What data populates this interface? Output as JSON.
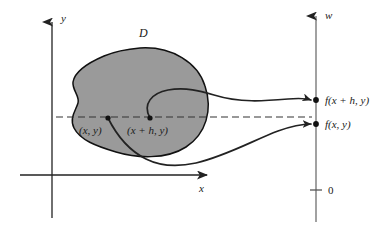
{
  "figure": {
    "background_color": "#ffffff",
    "line_color": "#222222",
    "region_fill_color": "#9a9a9a",
    "region_stroke_color": "#111111",
    "dash_color": "#333333"
  },
  "axes": {
    "y_axis_label": "y",
    "x_axis_label": "x",
    "w_axis_label": "w",
    "origin_tick_label": "0"
  },
  "region": {
    "label": "D"
  },
  "points": [
    {
      "id": "point-xy",
      "label": "(x, y)"
    },
    {
      "id": "point-xhy",
      "label": "(x + h, y)"
    }
  ],
  "values": [
    {
      "id": "value-fxhy",
      "label": "f(x + h, y)"
    },
    {
      "id": "value-fxy",
      "label": "f(x, y)"
    }
  ]
}
